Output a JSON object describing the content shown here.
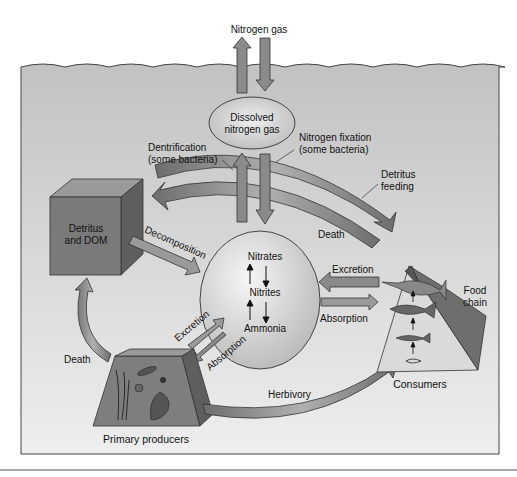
{
  "diagram": {
    "nodes": {
      "nitrogen_gas": "Nitrogen gas",
      "dissolved_line1": "Dissolved",
      "dissolved_line2": "nitrogen gas",
      "detritus_line1": "Detritus",
      "detritus_line2": "and DOM",
      "nitrates": "Nitrates",
      "nitrites": "Nitrites",
      "ammonia": "Ammonia",
      "primary_producers": "Primary producers",
      "consumers": "Consumers",
      "food_chain_line1": "Food",
      "food_chain_line2": "chain"
    },
    "processes": {
      "dentrification_line1": "Dentrification",
      "dentrification_line2": "(some bacteria)",
      "fixation_line1": "Nitrogen fixation",
      "fixation_line2": "(some bacteria)",
      "detritus_feeding_line1": "Detritus",
      "detritus_feeding_line2": "feeding",
      "death_consumers": "Death",
      "decomposition": "Decomposition",
      "excretion_consumers": "Excretion",
      "absorption_consumers": "Absorption",
      "excretion_producers": "Excretion",
      "absorption_producers": "Absorption",
      "death_producers": "Death",
      "herbivory": "Herbivory"
    },
    "colors": {
      "water": "#c9c9c9",
      "arrow_fill": "#8a8a8a",
      "box_front": "#7a7a7a",
      "box_top": "#9a9a9a",
      "box_side": "#5e5e5e",
      "sphere": "#dcdcdc",
      "outline": "#333333"
    }
  }
}
